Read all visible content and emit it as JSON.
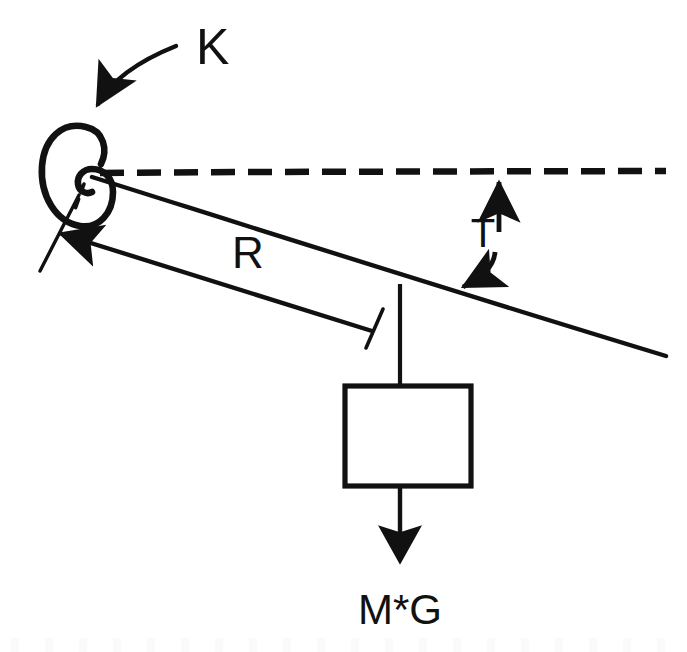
{
  "figure": {
    "kind": "mechanics-free-body-diagram",
    "canvas": {
      "width": 687,
      "height": 652
    },
    "background_color": "#ffffff",
    "ink_color": "#111111"
  },
  "labels": {
    "spring_constant": "K",
    "radius": "R",
    "angle": "T",
    "weight": "M*G"
  },
  "elements": {
    "torsion_spring": {
      "name": "torsional-spring-spiral",
      "center_x": 82,
      "center_y": 175,
      "outer_rx": 32,
      "outer_ry": 40
    },
    "pivot": {
      "x": 88,
      "y": 173
    },
    "reference_line": {
      "name": "horizontal-dashed-reference",
      "x1": 100,
      "y1": 172,
      "x2": 666,
      "y2": 172,
      "dash": "22 12",
      "stroke_width": 6
    },
    "rod": {
      "name": "rigid-rod",
      "x1": 93,
      "y1": 176,
      "x2": 666,
      "y2": 356,
      "stroke_width": 4
    },
    "dimension_arrow_R": {
      "x1": 372,
      "y1": 330,
      "x2": 56,
      "y2": 232
    },
    "tick_mark_R": {
      "x1": 366,
      "y1": 345,
      "x2": 380,
      "y2": 310
    },
    "tick_mark_pivot": {
      "x1": 40,
      "y1": 270,
      "x2": 78,
      "y2": 196
    },
    "angle_indicator": {
      "top_arrow_tip": {
        "x": 499,
        "y": 176
      },
      "bottom_arrow_tip": {
        "x": 456,
        "y": 291
      },
      "label_x": 483,
      "label_y": 237
    },
    "hanger_string": {
      "x1": 400,
      "y1": 286,
      "x2": 400,
      "y2": 386
    },
    "mass_block": {
      "name": "mass-block",
      "x": 345,
      "y": 386,
      "width": 126,
      "height": 100,
      "stroke_width": 5
    },
    "weight_arrow": {
      "x1": 400,
      "y1": 486,
      "x2": 400,
      "y2": 565
    },
    "k_callout_arrow": {
      "start": {
        "x": 176,
        "y": 45
      },
      "end": {
        "x": 96,
        "y": 108
      },
      "label_x": 196,
      "label_y": 64
    }
  },
  "text_positions": {
    "K": {
      "x": 196,
      "y": 64,
      "font_size": 50
    },
    "R": {
      "x": 232,
      "y": 268,
      "font_size": 42
    },
    "T": {
      "x": 483,
      "y": 243,
      "font_size": 40
    },
    "M*G": {
      "x": 400,
      "y": 624,
      "font_size": 40
    }
  }
}
